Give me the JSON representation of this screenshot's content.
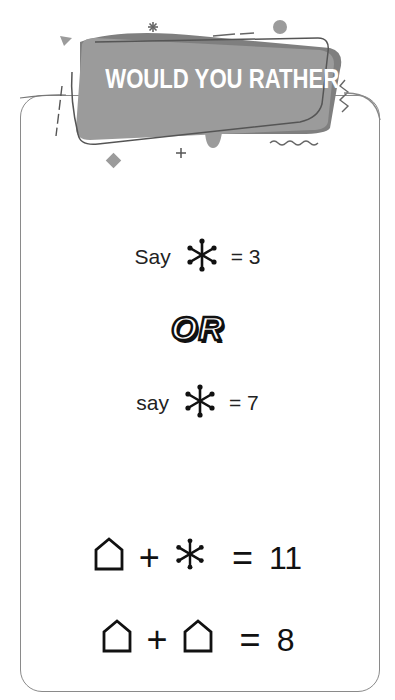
{
  "banner": {
    "title": "WOULD YOU RATHER",
    "colors": {
      "banner_fill": "#9b9b9b",
      "outline": "#5a5a5a",
      "text": "#ffffff"
    }
  },
  "card": {
    "border_color": "#8a8a8a"
  },
  "options": [
    {
      "word": "Say",
      "symbol": "snowflake-icon",
      "equals": "= 3"
    },
    {
      "word": "say",
      "symbol": "snowflake-icon",
      "equals": "= 7"
    }
  ],
  "separator": {
    "text": "OR"
  },
  "equations": [
    {
      "left": "house-icon",
      "operator": "+",
      "right": "snowflake-icon",
      "equals": "=",
      "result": "11"
    },
    {
      "left": "house-icon",
      "operator": "+",
      "right": "house-icon",
      "equals": "=",
      "result": "8"
    }
  ]
}
